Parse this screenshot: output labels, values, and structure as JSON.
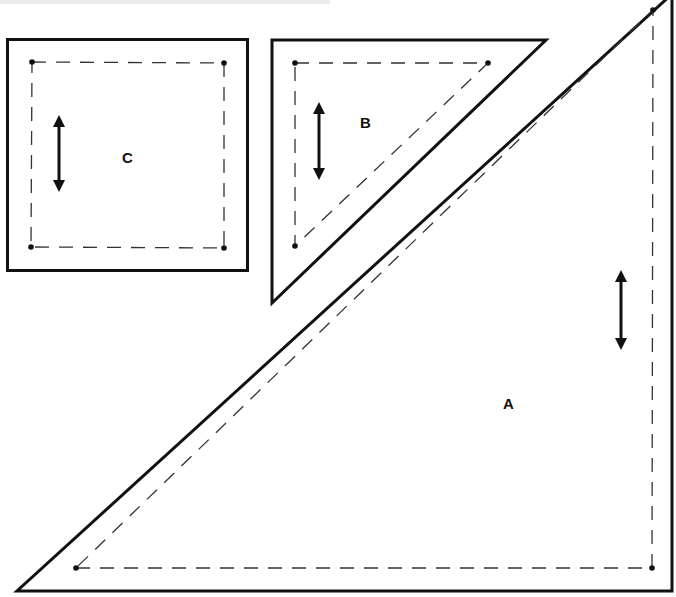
{
  "diagram": {
    "colors": {
      "outline": "#111111",
      "seam": "#333333",
      "background": "#ffffff"
    },
    "pieces": [
      {
        "id": "A",
        "label": "A",
        "shape": "right-triangle",
        "outline": [
          [
            17,
            591
          ],
          [
            672,
            591
          ],
          [
            672,
            -6
          ]
        ],
        "seam": [
          [
            76,
            568
          ],
          [
            652,
            568
          ],
          [
            653,
            10
          ]
        ],
        "grain_arrow": {
          "x": 621,
          "y1": 270,
          "y2": 350
        },
        "label_pos": [
          509,
          409
        ]
      },
      {
        "id": "B",
        "label": "B",
        "shape": "right-triangle",
        "outline": [
          [
            272,
            40
          ],
          [
            546,
            40
          ],
          [
            272,
            303
          ]
        ],
        "seam": [
          [
            295,
            63
          ],
          [
            488,
            63
          ],
          [
            295,
            246
          ]
        ],
        "grain_arrow": {
          "x": 319,
          "y1": 102,
          "y2": 180
        },
        "label_pos": [
          365,
          128
        ]
      },
      {
        "id": "C",
        "label": "C",
        "shape": "square",
        "outline": [
          [
            7,
            39
          ],
          [
            248,
            39
          ],
          [
            248,
            271
          ],
          [
            7,
            271
          ]
        ],
        "seam": [
          [
            32,
            62
          ],
          [
            224,
            62
          ],
          [
            224,
            248
          ],
          [
            31,
            248
          ]
        ],
        "grain_arrow": {
          "x": 59,
          "y1": 115,
          "y2": 192
        },
        "label_pos": [
          128,
          163
        ]
      }
    ]
  }
}
